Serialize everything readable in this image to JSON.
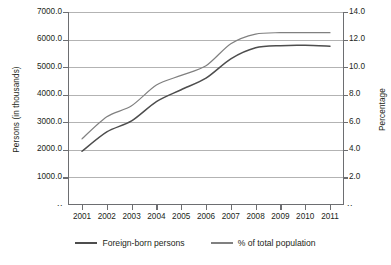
{
  "chart_data": {
    "type": "line",
    "title": "",
    "xlabel": "",
    "ylabel": "Persons (in thousands)",
    "y2label": "Percentage",
    "categories": [
      "2001",
      "2002",
      "2003",
      "2004",
      "2005",
      "2006",
      "2007",
      "2008",
      "2009",
      "2010",
      "2011"
    ],
    "x": [
      2001,
      2002,
      2003,
      2004,
      2005,
      2006,
      2007,
      2008,
      2009,
      2010,
      2011
    ],
    "ylim": [
      0,
      7000
    ],
    "y2lim": [
      0,
      14
    ],
    "yticks": [
      "1000.0",
      "2000.0",
      "3000.0",
      "4000.0",
      "5000.0",
      "6000.0",
      "7000.0"
    ],
    "ytick_values": [
      1000,
      2000,
      3000,
      4000,
      5000,
      6000,
      7000
    ],
    "y2ticks": [
      "2.0",
      "4.0",
      "6.0",
      "8.0",
      "10.0",
      "12.0",
      "14.0"
    ],
    "y2tick_values": [
      2,
      4,
      6,
      8,
      10,
      12,
      14
    ],
    "grid": true,
    "legend_position": "bottom",
    "axis_break_symbol": "..",
    "series": [
      {
        "name": "Foreign-born persons",
        "axis": "left",
        "color": "#4d4d4d",
        "values": [
          1950,
          2650,
          3050,
          3750,
          4180,
          4600,
          5300,
          5700,
          5780,
          5790,
          5760
        ]
      },
      {
        "name": "% of total population",
        "axis": "right",
        "color": "#808080",
        "values": [
          4.8,
          6.4,
          7.2,
          8.7,
          9.4,
          10.1,
          11.7,
          12.4,
          12.5,
          12.5,
          12.5
        ]
      }
    ]
  },
  "legend": {
    "items": [
      {
        "label": "Foreign-born persons",
        "color": "#4d4d4d"
      },
      {
        "label": "% of total population",
        "color": "#808080"
      }
    ]
  },
  "colors": {
    "axis": "#6d6e71",
    "grid": "#b3b3b3",
    "text": "#231f20",
    "background": "#ffffff"
  }
}
